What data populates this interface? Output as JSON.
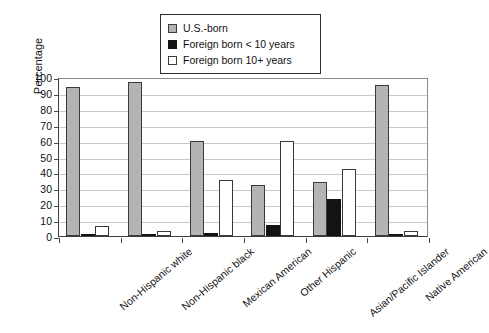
{
  "chart_data": {
    "type": "bar",
    "title": "",
    "xlabel": "",
    "ylabel": "Percentage",
    "ylim": [
      0,
      100
    ],
    "ytick_step": 10,
    "yticks": [
      100,
      90,
      80,
      70,
      60,
      50,
      40,
      30,
      20,
      10,
      0
    ],
    "grid": true,
    "legend_position": "top-center",
    "categories": [
      "Non-Hispanic white",
      "Non-Hispanic black",
      "Mexican American",
      "Other Hispanic",
      "Asian/Pacific Islander",
      "Native American"
    ],
    "series": [
      {
        "name": "U.S.-born",
        "color": "#b4b4b4",
        "values": [
          94,
          97,
          60,
          32,
          34,
          95
        ]
      },
      {
        "name": "Foreign born < 10 years",
        "color": "#131313",
        "values": [
          0.5,
          0.5,
          2,
          7,
          23,
          0.5
        ]
      },
      {
        "name": "Foreign born 10+ years",
        "color": "#ffffff",
        "values": [
          6,
          3,
          35,
          60,
          42,
          3
        ]
      }
    ]
  },
  "legend": {
    "items": [
      {
        "label": "U.S.-born",
        "swatch": "usborn"
      },
      {
        "label": "Foreign born < 10 years",
        "swatch": "fb10"
      },
      {
        "label": "Foreign born 10+ years",
        "swatch": "fb10p"
      }
    ]
  },
  "axis": {
    "y_title": "Percentage"
  }
}
